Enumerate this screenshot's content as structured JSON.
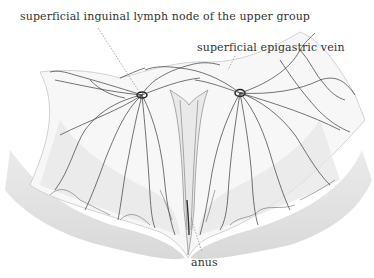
{
  "figure": {
    "type": "anatomical illustration",
    "labels": {
      "upper_lymph_node": "superficial inguinal lymph node of the upper group",
      "epigastric_vein": "superficial epigastric vein",
      "anus": "anus"
    },
    "colors": {
      "background": "#ffffff",
      "vessel": "#3a3a3a",
      "skin_shading": "#d8d8d8",
      "leader_line": "#888888",
      "label_text": "#333333"
    }
  }
}
